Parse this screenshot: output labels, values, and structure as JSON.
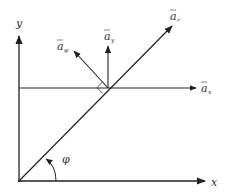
{
  "diagram": {
    "colors": {
      "stroke": "#222222",
      "text": "#333333",
      "background": "#ffffff"
    },
    "labels": {
      "x_axis": "x",
      "y_axis": "y",
      "angle": "φ",
      "a_r": {
        "base": "a",
        "sub": "r"
      },
      "a_phi": {
        "base": "a",
        "sub": "φ"
      },
      "a_x": {
        "base": "a",
        "sub": "x"
      },
      "a_y": {
        "base": "a",
        "sub": "y"
      }
    },
    "elements": [
      "x-axis arrow",
      "y-axis arrow",
      "radial line with a_r arrow",
      "horizontal a_x arrow",
      "vertical a_y arrow",
      "a_phi arrow perpendicular to a_r",
      "right-angle marker",
      "angle arc phi"
    ]
  }
}
